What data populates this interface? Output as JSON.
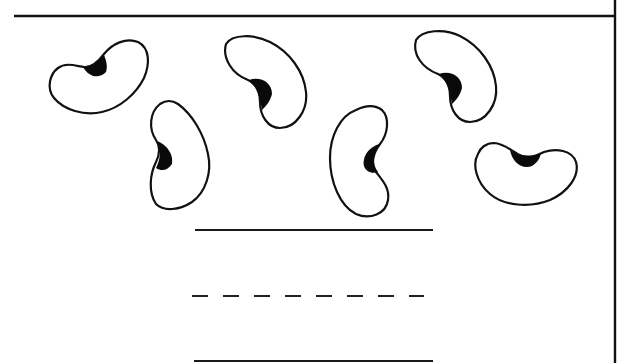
{
  "worksheet": {
    "description": "Handwriting worksheet with six bean drawings above writing guide lines",
    "colors": {
      "ink": "#111111",
      "paper": "#ffffff"
    },
    "frame": {
      "top_rule": {
        "x1": 14,
        "x2": 616,
        "y": 16
      },
      "right_border": {
        "x": 615,
        "y1": 0,
        "y2": 363
      }
    },
    "beans": [
      {
        "id": 1,
        "label": "bean",
        "hilum": "top"
      },
      {
        "id": 2,
        "label": "bean",
        "hilum": "left"
      },
      {
        "id": 3,
        "label": "bean",
        "hilum": "left"
      },
      {
        "id": 4,
        "label": "bean",
        "hilum": "right"
      },
      {
        "id": 5,
        "label": "bean",
        "hilum": "left"
      },
      {
        "id": 6,
        "label": "bean",
        "hilum": "top"
      }
    ],
    "bean_count": 6,
    "writing_lines": [
      {
        "type": "solid",
        "role": "top-line",
        "x1": 195,
        "x2": 433,
        "y": 230
      },
      {
        "type": "dashed",
        "role": "mid-line",
        "x1": 192,
        "x2": 424,
        "y": 296,
        "dash_count": 8
      },
      {
        "type": "solid",
        "role": "base-line",
        "x1": 194,
        "x2": 433,
        "y": 361
      }
    ]
  }
}
